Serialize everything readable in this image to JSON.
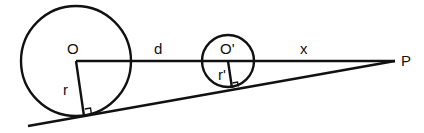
{
  "diagram": {
    "labels": {
      "big_center": "O",
      "small_center": "O'",
      "point": "P",
      "big_radius": "r",
      "small_radius": "r'",
      "distance_centers": "d",
      "distance_to_p": "x"
    },
    "stroke_color": "#111111",
    "background": "#ffffff"
  }
}
